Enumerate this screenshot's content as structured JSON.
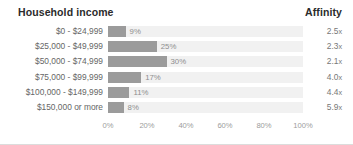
{
  "header": {
    "title": "Household income",
    "affinity_label": "Affinity"
  },
  "colors": {
    "bar_fill": "#9b9b9b",
    "track": "#f1f1f1",
    "label_text": "#666666",
    "value_text": "#8e8e8e",
    "axis_text": "#9c9c9c",
    "header_text": "#2b2b2b",
    "background": "#ffffff",
    "border": "#dcdcdc"
  },
  "chart_data": {
    "type": "bar",
    "orientation": "horizontal",
    "title": "Household income",
    "xlabel": "",
    "ylabel": "",
    "xlim": [
      0,
      100
    ],
    "grid": false,
    "legend": "none",
    "categories": [
      "$0 - $24,999",
      "$25,000 - $49,999",
      "$50,000 - $74,999",
      "$75,000 - $99,999",
      "$100,000 - $149,999",
      "$150,000 or more"
    ],
    "values": [
      9,
      25,
      30,
      17,
      11,
      8
    ],
    "value_labels": [
      "9%",
      "25%",
      "30%",
      "17%",
      "11%",
      "8%"
    ],
    "affinity": [
      "2.5x",
      "2.3x",
      "2.1x",
      "4.0x",
      "4.4x",
      "5.9x"
    ],
    "affinity_values": [
      2.5,
      2.3,
      2.1,
      4.0,
      4.4,
      5.9
    ],
    "xticks": [
      0,
      20,
      40,
      60,
      80,
      100
    ],
    "xticklabels": [
      "0%",
      "20%",
      "40%",
      "60%",
      "80%",
      "100%"
    ]
  }
}
